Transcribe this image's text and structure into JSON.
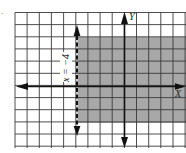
{
  "figure": {
    "type": "coordinate-plane-inequality",
    "marker": ".",
    "axes": {
      "x_label": "X",
      "y_label": "Y"
    },
    "grid": {
      "x_min": -9,
      "x_max": 5,
      "y_min": -5,
      "y_max": 6,
      "cell_px": 12.15
    },
    "boundary_line": {
      "label": "x = −4",
      "x": -4,
      "style": "dashed",
      "arrows": "both"
    },
    "shaded_region": {
      "x_from": -4,
      "x_to": "right edge",
      "y_from": -3,
      "y_to": 4,
      "description": "x > −4 with −3 ≤ y ≤ 4 shaded"
    },
    "colors": {
      "grid": "#3a3a3a",
      "shade": "#a8a8a8",
      "axis": "#111111",
      "background": "#ffffff"
    }
  }
}
